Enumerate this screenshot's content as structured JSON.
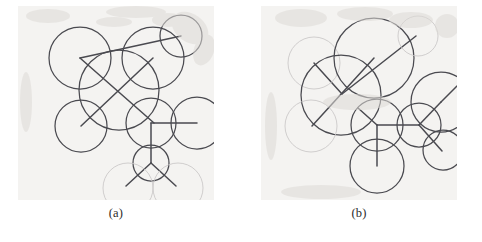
{
  "figure": {
    "background_color": "#ffffff",
    "plate_color": "#f4f3f1",
    "ink_dark": "#4a4a50",
    "ink_light": "#c9c6c6",
    "caption_color": "#2b2b2b"
  },
  "panels": [
    {
      "id": "a",
      "caption": "(a)",
      "view_box": "0 0 196 194",
      "circles": [
        {
          "name": "circle-upper-left",
          "cx": 62,
          "cy": 52,
          "r": 31,
          "tone": "dark"
        },
        {
          "name": "circle-center-large",
          "cx": 101,
          "cy": 84,
          "r": 40,
          "tone": "dark"
        },
        {
          "name": "circle-upper-right",
          "cx": 135,
          "cy": 52,
          "r": 31,
          "tone": "dark"
        },
        {
          "name": "circle-top-right-small",
          "cx": 163,
          "cy": 30,
          "r": 21,
          "tone": "dark"
        },
        {
          "name": "circle-left-lower",
          "cx": 63,
          "cy": 120,
          "r": 26,
          "tone": "dark"
        },
        {
          "name": "circle-mid-right",
          "cx": 133,
          "cy": 117,
          "r": 25,
          "tone": "dark"
        },
        {
          "name": "circle-far-right",
          "cx": 179,
          "cy": 117,
          "r": 26,
          "tone": "dark"
        },
        {
          "name": "circle-lower-center",
          "cx": 133,
          "cy": 157,
          "r": 18,
          "tone": "dark"
        },
        {
          "name": "circle-bottom-left-faint",
          "cx": 110,
          "cy": 182,
          "r": 25,
          "tone": "light"
        },
        {
          "name": "circle-bottom-right-faint",
          "cx": 160,
          "cy": 182,
          "r": 25,
          "tone": "light"
        }
      ],
      "segments": [
        {
          "name": "segment-diagonal-long-ne",
          "x1": 62,
          "y1": 52,
          "x2": 163,
          "y2": 30,
          "tone": "dark"
        },
        {
          "name": "segment-diagonal-main-nw-se",
          "x1": 62,
          "y1": 52,
          "x2": 136,
          "y2": 117,
          "tone": "dark"
        },
        {
          "name": "segment-diagonal-main-ne-sw",
          "x1": 135,
          "y1": 52,
          "x2": 63,
          "y2": 120,
          "tone": "dark"
        },
        {
          "name": "segment-hub-vertical",
          "x1": 133,
          "y1": 117,
          "x2": 133,
          "y2": 157,
          "tone": "dark"
        },
        {
          "name": "segment-hub-horizontal",
          "x1": 133,
          "y1": 117,
          "x2": 179,
          "y2": 117,
          "tone": "dark"
        },
        {
          "name": "segment-fork-left",
          "x1": 133,
          "y1": 157,
          "x2": 108,
          "y2": 180,
          "tone": "dark"
        },
        {
          "name": "segment-fork-right",
          "x1": 133,
          "y1": 157,
          "x2": 158,
          "y2": 180,
          "tone": "dark"
        }
      ]
    },
    {
      "id": "b",
      "caption": "(b)",
      "view_box": "0 0 196 194",
      "circles": [
        {
          "name": "circle-left-faint-upper",
          "cx": 53,
          "cy": 57,
          "r": 26,
          "tone": "light"
        },
        {
          "name": "circle-center-large",
          "cx": 80,
          "cy": 89,
          "r": 40,
          "tone": "dark"
        },
        {
          "name": "circle-top-right-large",
          "cx": 113,
          "cy": 52,
          "r": 40,
          "tone": "dark"
        },
        {
          "name": "circle-top-corner-faint",
          "cx": 157,
          "cy": 30,
          "r": 20,
          "tone": "light"
        },
        {
          "name": "circle-left-lower-faint",
          "cx": 50,
          "cy": 120,
          "r": 26,
          "tone": "light"
        },
        {
          "name": "circle-hub-left",
          "cx": 116,
          "cy": 119,
          "r": 26,
          "tone": "dark"
        },
        {
          "name": "circle-hub-right",
          "cx": 158,
          "cy": 119,
          "r": 22,
          "tone": "dark"
        },
        {
          "name": "circle-far-right-large",
          "cx": 180,
          "cy": 96,
          "r": 30,
          "tone": "dark"
        },
        {
          "name": "circle-right-lower",
          "cx": 182,
          "cy": 144,
          "r": 20,
          "tone": "dark"
        },
        {
          "name": "circle-bottom-center",
          "cx": 116,
          "cy": 160,
          "r": 27,
          "tone": "dark"
        }
      ],
      "segments": [
        {
          "name": "segment-diagonal-long-ne",
          "x1": 81,
          "y1": 88,
          "x2": 155,
          "y2": 30,
          "tone": "dark"
        },
        {
          "name": "segment-diagonal-nw",
          "x1": 81,
          "y1": 88,
          "x2": 53,
          "y2": 57,
          "tone": "dark"
        },
        {
          "name": "segment-diagonal-sw",
          "x1": 113,
          "y1": 52,
          "x2": 51,
          "y2": 120,
          "tone": "dark"
        },
        {
          "name": "segment-hub-left-up",
          "x1": 116,
          "y1": 119,
          "x2": 97,
          "y2": 102,
          "tone": "dark"
        },
        {
          "name": "segment-hub-horizontal",
          "x1": 116,
          "y1": 119,
          "x2": 158,
          "y2": 119,
          "tone": "dark"
        },
        {
          "name": "segment-hub-vertical",
          "x1": 116,
          "y1": 119,
          "x2": 116,
          "y2": 160,
          "tone": "dark"
        },
        {
          "name": "segment-right-hub-up",
          "x1": 158,
          "y1": 119,
          "x2": 180,
          "y2": 96,
          "tone": "dark"
        },
        {
          "name": "segment-right-hub-down",
          "x1": 158,
          "y1": 119,
          "x2": 181,
          "y2": 145,
          "tone": "dark"
        },
        {
          "name": "segment-far-right-spoke",
          "x1": 180,
          "y1": 96,
          "x2": 196,
          "y2": 80,
          "tone": "dark"
        }
      ]
    }
  ]
}
